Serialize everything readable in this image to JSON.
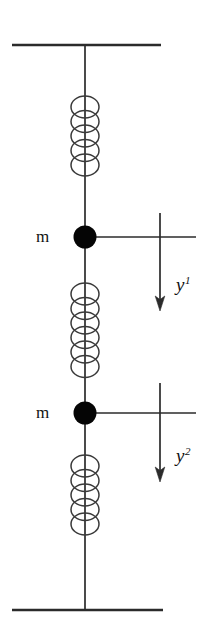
{
  "figure": {
    "type": "mechanical-schematic",
    "colors": {
      "stroke": "#2b2b2b",
      "mass_fill": "#050505",
      "background": "#ffffff",
      "text": "#111111"
    },
    "supports": {
      "top": {
        "name": "top-fixed-support",
        "x1": 12,
        "x2": 161,
        "y": 45
      },
      "bottom": {
        "name": "bottom-fixed-support",
        "x1": 12,
        "x2": 163,
        "y": 610
      }
    },
    "rod": {
      "x": 85,
      "y1": 45,
      "y2": 610
    },
    "springs": [
      {
        "id": "spring-1",
        "cx": 85,
        "top": 96,
        "coils": 5,
        "rx": 14,
        "ry": 11,
        "pitch": 14.5
      },
      {
        "id": "spring-2",
        "cx": 85,
        "top": 283,
        "coils": 6,
        "rx": 14,
        "ry": 11,
        "pitch": 14.5
      },
      {
        "id": "spring-3",
        "cx": 85,
        "top": 455,
        "coils": 5,
        "rx": 14,
        "ry": 11,
        "pitch": 14.5
      }
    ],
    "masses": [
      {
        "id": "mass-1",
        "label": "m",
        "cx": 85,
        "cy": 237,
        "r": 11.5,
        "ref_line_x2": 196,
        "label_x": 36,
        "label_y": 228
      },
      {
        "id": "mass-2",
        "label": "m",
        "cx": 85,
        "cy": 413,
        "r": 11.5,
        "ref_line_x2": 196,
        "label_x": 36,
        "label_y": 404
      }
    ],
    "displacements": [
      {
        "id": "displacement-1",
        "symbol": "y",
        "superscript": "1",
        "arrow_x": 160,
        "arrow_y1": 213,
        "arrow_y2": 309,
        "label_x": 176,
        "label_y": 275
      },
      {
        "id": "displacement-2",
        "symbol": "y",
        "superscript": "2",
        "arrow_x": 160,
        "arrow_y1": 383,
        "arrow_y2": 480,
        "label_x": 176,
        "label_y": 446
      }
    ]
  },
  "labels": {
    "mass_1": "m",
    "mass_2": "m",
    "displacement_1_symbol": "y",
    "displacement_1_superscript": "1",
    "displacement_2_symbol": "y",
    "displacement_2_superscript": "2"
  }
}
